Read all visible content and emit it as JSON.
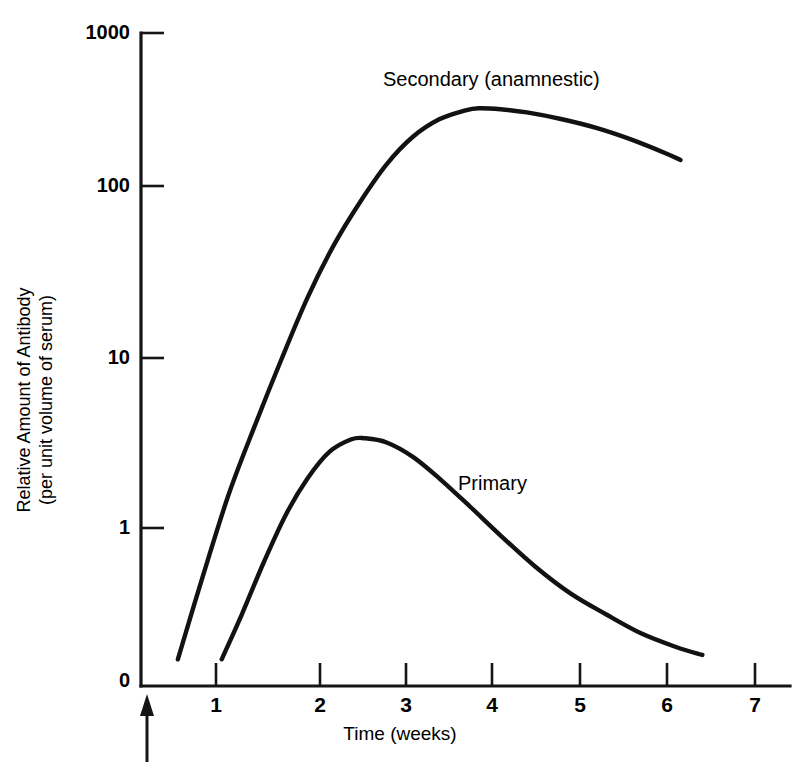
{
  "figure": {
    "background_color": "#ffffff",
    "ink_color": "#121212"
  },
  "chart_data": {
    "type": "line",
    "title": "",
    "subtitle": "",
    "xlabel": "Time (weeks)",
    "ylabel": "Relative Amount of Antibody",
    "ylabel_line2": "(per unit volume of serum)",
    "yscale": "log",
    "xscale": "linear",
    "xlim": [
      0,
      7.5
    ],
    "ylim": [
      0,
      1000
    ],
    "grid": false,
    "legend_position": "inline-annotations",
    "y_tick_labels": [
      "1000",
      "100",
      "10",
      "1",
      "0"
    ],
    "y_tick_values": [
      1000,
      100,
      10,
      1,
      0
    ],
    "x_tick_labels": [
      "1",
      "2",
      "3",
      "4",
      "5",
      "6",
      "7"
    ],
    "x_tick_values": [
      1,
      2,
      3,
      4,
      5,
      6,
      7
    ],
    "annotations": [
      {
        "name": "antigen-administration-arrow",
        "text": "",
        "x": 0,
        "y": 0,
        "description": "upward arrow at time zero marking antigen administration"
      }
    ],
    "series": [
      {
        "name": "Secondary (anamnestic)",
        "label": "Secondary (anamnestic)",
        "label_x": 4.05,
        "label_y": 520,
        "x": [
          0.42,
          0.7,
          1.0,
          1.3,
          1.6,
          1.9,
          2.2,
          2.5,
          2.8,
          3.1,
          3.4,
          3.7,
          3.85,
          4.1,
          4.4,
          4.8,
          5.2,
          5.6,
          6.0,
          6.15
        ],
        "y": [
          0.16,
          0.5,
          1.6,
          4.2,
          10.5,
          25,
          52,
          95,
          160,
          235,
          300,
          340,
          350,
          345,
          330,
          300,
          265,
          225,
          185,
          170
        ]
      },
      {
        "name": "Primary",
        "label": "Primary",
        "label_x": 3.95,
        "label_y": 2.3,
        "x": [
          0.92,
          1.15,
          1.4,
          1.65,
          1.9,
          2.15,
          2.4,
          2.55,
          2.8,
          3.1,
          3.4,
          3.75,
          4.1,
          4.5,
          4.9,
          5.3,
          5.7,
          6.1,
          6.4
        ],
        "y": [
          0.16,
          0.3,
          0.62,
          1.2,
          2.0,
          2.9,
          3.45,
          3.5,
          3.3,
          2.7,
          2.0,
          1.35,
          0.9,
          0.58,
          0.4,
          0.3,
          0.23,
          0.19,
          0.17
        ]
      }
    ]
  },
  "geometry": {
    "note": "pixel anchors used by the renderer",
    "plot_left": 141,
    "plot_bottom": 686,
    "plot_right": 790,
    "plot_top": 33,
    "y_pixels": {
      "1000": 33,
      "100": 186,
      "10": 358,
      "1": 528,
      "0": 686
    },
    "x_pixels": {
      "0": 141,
      "1": 216,
      "2": 320,
      "3": 406,
      "4": 492,
      "5": 580,
      "6": 667,
      "7": 755
    }
  }
}
